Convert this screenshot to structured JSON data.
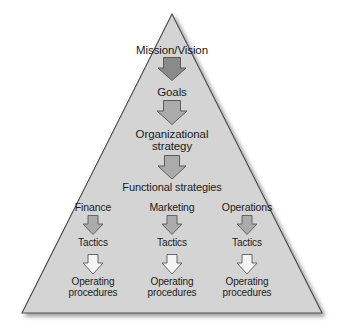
{
  "figure": {
    "type": "pyramid-hierarchy-diagram",
    "background_color": "#ffffff",
    "pyramid_fill": "#d4d4d4",
    "pyramid_stroke": "#4a4a4a",
    "text_color": "#1b1b1b",
    "arrow_dark_fill": "#8a8a8a",
    "arrow_mid_fill": "#ababab",
    "arrow_light_fill": "#f4f4f4",
    "arrow_stroke": "#5a5a5a"
  },
  "nodes": {
    "mission": "Mission/Vision",
    "goals": "Goals",
    "org_strategy": "Organizational\nstrategy",
    "functional_strategies": "Functional strategies"
  },
  "columns": [
    {
      "area": "Finance",
      "tactics": "Tactics",
      "operating": "Operating\nprocedures"
    },
    {
      "area": "Marketing",
      "tactics": "Tactics",
      "operating": "Operating\nprocedures"
    },
    {
      "area": "Operations",
      "tactics": "Tactics",
      "operating": "Operating\nprocedures"
    }
  ],
  "arrows": [
    {
      "name": "arrow-mission-to-goals",
      "shade": "dark"
    },
    {
      "name": "arrow-goals-to-org-strategy",
      "shade": "mid"
    },
    {
      "name": "arrow-org-strategy-to-functional",
      "shade": "mid"
    },
    {
      "name": "arrow-finance-to-tactics",
      "shade": "mid"
    },
    {
      "name": "arrow-marketing-to-tactics",
      "shade": "mid"
    },
    {
      "name": "arrow-operations-to-tactics",
      "shade": "mid"
    },
    {
      "name": "arrow-finance-tactics-to-operating",
      "shade": "light"
    },
    {
      "name": "arrow-marketing-tactics-to-operating",
      "shade": "light"
    },
    {
      "name": "arrow-operations-tactics-to-operating",
      "shade": "light"
    }
  ]
}
